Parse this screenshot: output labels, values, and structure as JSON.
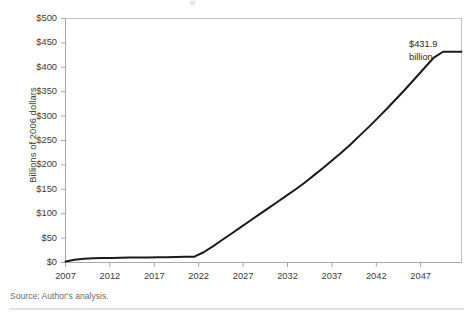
{
  "figure": {
    "source_note": "Source: Author's analysis.",
    "annotation": {
      "line1": "$431.9",
      "line2": "billion"
    }
  },
  "chart_data": {
    "type": "line",
    "title": "",
    "xlabel": "",
    "ylabel": "Billions of 2006 dollars",
    "xlim": [
      2007,
      2050
    ],
    "ylim": [
      0,
      500
    ],
    "grid": false,
    "legend": null,
    "y_tick_labels": [
      "$500",
      "$450",
      "$400",
      "$350",
      "$300",
      "$250",
      "$200",
      "$150",
      "$100",
      "$50",
      "$0"
    ],
    "y_tick_values": [
      500,
      450,
      400,
      350,
      300,
      250,
      200,
      150,
      100,
      50,
      0
    ],
    "x_tick_labels": [
      "2007",
      "2012",
      "2017",
      "2022",
      "2027",
      "2032",
      "2037",
      "2042",
      "2047"
    ],
    "x_tick_values": [
      2007,
      2012,
      2017,
      2022,
      2027,
      2032,
      2037,
      2042,
      2047
    ],
    "line_color": "#1a1a1a",
    "series": [
      {
        "name": "Projected cost",
        "x": [
          2007,
          2008,
          2009,
          2010,
          2011,
          2012,
          2013,
          2014,
          2015,
          2016,
          2017,
          2018,
          2019,
          2020,
          2021,
          2022,
          2023,
          2024,
          2025,
          2026,
          2027,
          2028,
          2029,
          2030,
          2031,
          2032,
          2033,
          2034,
          2035,
          2036,
          2037,
          2038,
          2039,
          2040,
          2041,
          2042,
          2043,
          2044,
          2045,
          2046,
          2047,
          2048,
          2049,
          2050
        ],
        "values": [
          2.0,
          5.5,
          7.5,
          8.5,
          9.0,
          9.4,
          9.7,
          10.0,
          10.2,
          10.5,
          10.8,
          11.0,
          11.3,
          11.6,
          12.0,
          21.0,
          33.0,
          46.0,
          59.0,
          72.0,
          85.0,
          98.0,
          111.0,
          124.0,
          137.0,
          150.0,
          164.0,
          179.0,
          194.0,
          210.0,
          226.0,
          243.0,
          261.0,
          279.0,
          298.0,
          317.0,
          337.0,
          357.0,
          378.0,
          399.0,
          420.0,
          431.9,
          431.9,
          431.9
        ]
      }
    ],
    "annotations": [
      {
        "text": "$431.9 billion",
        "x": 2048,
        "y": 431.9
      }
    ]
  }
}
